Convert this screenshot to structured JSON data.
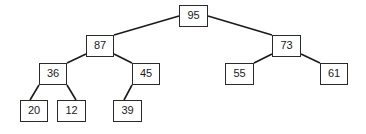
{
  "diagram": {
    "type": "binary-tree (max-heap)",
    "nodes": [
      {
        "id": "n95",
        "value": "95",
        "x": 179,
        "y": 5,
        "w": 29,
        "h": 22
      },
      {
        "id": "n87",
        "value": "87",
        "x": 86,
        "y": 35,
        "w": 28,
        "h": 22
      },
      {
        "id": "n73",
        "value": "73",
        "x": 272,
        "y": 35,
        "w": 29,
        "h": 22
      },
      {
        "id": "n36",
        "value": "36",
        "x": 39,
        "y": 63,
        "w": 28,
        "h": 22
      },
      {
        "id": "n45",
        "value": "45",
        "x": 132,
        "y": 63,
        "w": 28,
        "h": 22
      },
      {
        "id": "n55",
        "value": "55",
        "x": 225,
        "y": 63,
        "w": 29,
        "h": 22
      },
      {
        "id": "n61",
        "value": "61",
        "x": 320,
        "y": 63,
        "w": 28,
        "h": 22
      },
      {
        "id": "n20",
        "value": "20",
        "x": 20,
        "y": 100,
        "w": 28,
        "h": 22
      },
      {
        "id": "n12",
        "value": "12",
        "x": 57,
        "y": 100,
        "w": 29,
        "h": 22
      },
      {
        "id": "n39",
        "value": "39",
        "x": 113,
        "y": 100,
        "w": 29,
        "h": 22
      }
    ],
    "edges": [
      {
        "from": "95",
        "to": "87",
        "x1": 179,
        "y1": 16,
        "x2": 114,
        "y2": 35
      },
      {
        "from": "95",
        "to": "73",
        "x1": 208,
        "y1": 16,
        "x2": 272,
        "y2": 35
      },
      {
        "from": "87",
        "to": "36",
        "x1": 86,
        "y1": 54,
        "x2": 67,
        "y2": 63
      },
      {
        "from": "87",
        "to": "45",
        "x1": 114,
        "y1": 54,
        "x2": 132,
        "y2": 63
      },
      {
        "from": "73",
        "to": "55",
        "x1": 272,
        "y1": 54,
        "x2": 254,
        "y2": 63
      },
      {
        "from": "73",
        "to": "61",
        "x1": 301,
        "y1": 54,
        "x2": 320,
        "y2": 63
      },
      {
        "from": "36",
        "to": "20",
        "x1": 39,
        "y1": 85,
        "x2": 30,
        "y2": 100
      },
      {
        "from": "36",
        "to": "12",
        "x1": 67,
        "y1": 85,
        "x2": 76,
        "y2": 100
      },
      {
        "from": "45",
        "to": "39",
        "x1": 132,
        "y1": 85,
        "x2": 124,
        "y2": 100
      }
    ]
  }
}
